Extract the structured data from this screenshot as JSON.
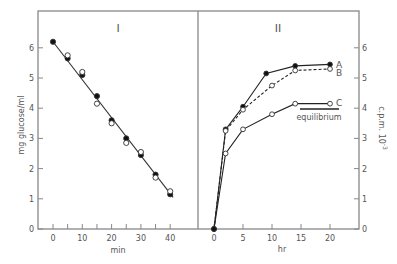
{
  "chart_data": [
    {
      "panel": "I",
      "type": "line",
      "title": "I",
      "xlabel": "min",
      "ylabel": "mg glucose/ml",
      "xlim": [
        -4,
        50
      ],
      "ylim": [
        0,
        7
      ],
      "xticks": [
        0,
        10,
        20,
        30,
        40
      ],
      "xticks_minor": [
        5,
        15,
        25,
        35
      ],
      "yticks": [
        0,
        1,
        2,
        3,
        4,
        5,
        6
      ],
      "grid": false,
      "series": [
        {
          "name": "filled",
          "marker": "filled-circle",
          "x": [
            0,
            5,
            10,
            15,
            20,
            25,
            30,
            35,
            40
          ],
          "y": [
            6.2,
            5.65,
            5.1,
            4.4,
            3.6,
            3.0,
            2.45,
            1.8,
            1.15
          ]
        },
        {
          "name": "open",
          "marker": "open-circle",
          "x": [
            5,
            10,
            15,
            20,
            25,
            30,
            35,
            40
          ],
          "y": [
            5.75,
            5.2,
            4.15,
            3.5,
            2.85,
            2.55,
            1.7,
            1.25
          ]
        },
        {
          "name": "fit",
          "marker": "none",
          "style": "solid",
          "x": [
            0,
            41
          ],
          "y": [
            6.2,
            1.05
          ]
        }
      ]
    },
    {
      "panel": "II",
      "type": "line",
      "title": "II",
      "xlabel": "hr",
      "ylabel": "c.p.m. 10^-3",
      "xlim": [
        -2,
        24
      ],
      "ylim": [
        0,
        7
      ],
      "xticks": [
        0,
        5,
        10,
        15,
        20
      ],
      "yticks": [
        0,
        1,
        2,
        3,
        4,
        5,
        6
      ],
      "y_axis_position": "right",
      "grid": false,
      "series": [
        {
          "name": "A",
          "marker": "filled-circle",
          "style": "solid",
          "x": [
            0,
            2,
            5,
            9,
            14,
            20
          ],
          "y": [
            0,
            3.3,
            4.05,
            5.15,
            5.4,
            5.45
          ]
        },
        {
          "name": "B",
          "marker": "open-circle",
          "style": "dashed",
          "x": [
            0,
            2,
            5,
            10,
            14,
            20
          ],
          "y": [
            0,
            3.25,
            3.95,
            4.75,
            5.25,
            5.3
          ]
        },
        {
          "name": "C",
          "marker": "open-circle",
          "style": "solid",
          "x": [
            0,
            2,
            5,
            10,
            14,
            20
          ],
          "y": [
            0,
            2.5,
            3.3,
            3.8,
            4.15,
            4.15
          ]
        }
      ],
      "annotations": [
        {
          "text": "equilibrium",
          "type": "hline",
          "y": 4.0,
          "x_range": [
            15,
            21.5
          ]
        }
      ]
    }
  ],
  "labels": {
    "panel_i_title": "I",
    "panel_ii_title": "II",
    "panel_i_xlabel": "min",
    "panel_ii_xlabel": "hr",
    "left_ylabel": "mg glucose/ml",
    "right_ylabel": "c.p.m. 10",
    "right_ylabel_exp": "-3",
    "equilibrium": "equilibrium",
    "legend_a": "A",
    "legend_b": "B",
    "legend_c": "C"
  }
}
